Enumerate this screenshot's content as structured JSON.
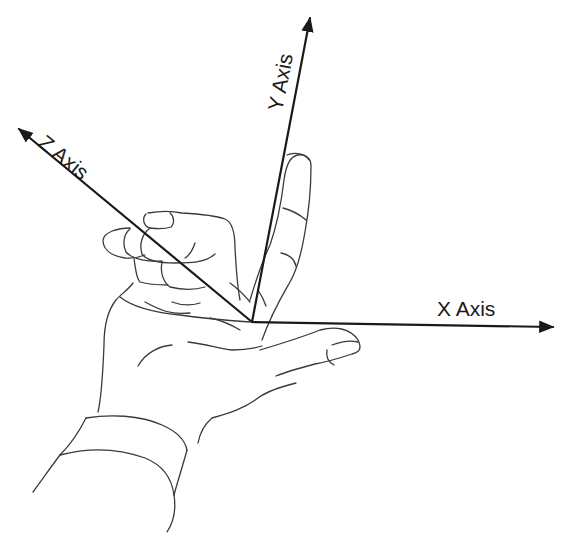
{
  "diagram": {
    "axes": {
      "x": {
        "label": "X Axis"
      },
      "y": {
        "label": "Y Axis"
      },
      "z": {
        "label": "Z Axis"
      }
    },
    "colors": {
      "background": "#ffffff",
      "axis_line": "#1a1a1a",
      "hand_outline": "#3a3a3a"
    }
  }
}
